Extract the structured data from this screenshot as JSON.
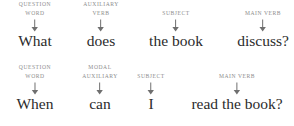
{
  "diagram": {
    "colors": {
      "background": "#ffffff",
      "label_text": "#8d8d8d",
      "word_text": "#2b2b2b",
      "arrow": "#6f6f6f"
    },
    "arrow_icon": "down-arrow-icon",
    "rows": [
      {
        "id": "sentence-1",
        "sentence": "What does the book discuss?",
        "constituents": [
          {
            "label_lines": [
              "Question",
              "Word"
            ],
            "label_text": "QUESTION WORD",
            "word": "What",
            "x": 35
          },
          {
            "label_lines": [
              "Auxiliary",
              "Verb"
            ],
            "label_text": "AUXILIARY VERB",
            "word": "does",
            "x": 101
          },
          {
            "label_lines": [
              "",
              "Subject"
            ],
            "label_text": "SUBJECT",
            "word": "the book",
            "x": 176
          },
          {
            "label_lines": [
              "",
              "Main Verb"
            ],
            "label_text": "MAIN VERB",
            "word": "discuss?",
            "x": 263
          }
        ]
      },
      {
        "id": "sentence-2",
        "sentence": "When can I read the book?",
        "constituents": [
          {
            "label_lines": [
              "Question",
              "Word"
            ],
            "label_text": "QUESTION WORD",
            "word": "When",
            "x": 35
          },
          {
            "label_lines": [
              "Modal",
              "Auxiliary"
            ],
            "label_text": "MODAL AUXILIARY",
            "word": "can",
            "x": 100
          },
          {
            "label_lines": [
              "",
              "Subject"
            ],
            "label_text": "SUBJECT",
            "word": "I",
            "x": 151
          },
          {
            "label_lines": [
              "",
              "Main Verb"
            ],
            "label_text": "MAIN VERB",
            "word": "read the book?",
            "x": 237
          }
        ]
      }
    ]
  }
}
